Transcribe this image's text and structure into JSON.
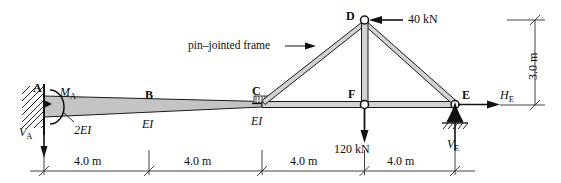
{
  "figure": {
    "annotation": "pin–jointed frame"
  },
  "nodes": {
    "a": "A",
    "b": "B",
    "c": "C",
    "d": "D",
    "e": "E",
    "f": "F"
  },
  "stiffness": {
    "segment_ab": "2EI",
    "segment_b": "EI",
    "segment_bc": "EI"
  },
  "loads": {
    "horizontal_at_d": "40 kN",
    "vertical_at_f": "120 kN"
  },
  "reactions": {
    "moment_a": "M",
    "moment_a_sub": "A",
    "vertical_a": "V",
    "vertical_a_sub": "A",
    "horizontal_e": "H",
    "horizontal_e_sub": "E",
    "vertical_e": "V",
    "vertical_e_sub": "E"
  },
  "dimensions": {
    "span_1": "4.0 m",
    "span_2": "4.0 m",
    "span_3": "4.0 m",
    "span_4": "4.0 m",
    "height": "3.0 m"
  },
  "colors": {
    "line": "#111111",
    "member_fill": "#c9c9c9",
    "beam_fill": "#c4c4c4",
    "dim_line": "#3a3a3a",
    "text": "#0d0d0d"
  }
}
